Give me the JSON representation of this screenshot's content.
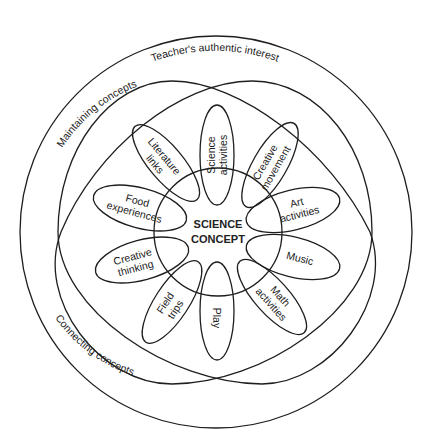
{
  "diagram": {
    "outer_ring_label": "Teacher's authentic interest",
    "left_upper_label": "Maintaining concepts",
    "left_lower_label": "Connecting concepts",
    "center": {
      "line1": "SCIENCE",
      "line2": "CONCEPT"
    },
    "petals": [
      {
        "id": "science-activities",
        "line1": "Science",
        "line2": "activities"
      },
      {
        "id": "creative-movement",
        "line1": "Creative",
        "line2": "movement"
      },
      {
        "id": "art-activities",
        "line1": "Art",
        "line2": "activities"
      },
      {
        "id": "music",
        "line1": "Music",
        "line2": ""
      },
      {
        "id": "math-activities",
        "line1": "Math",
        "line2": "activities"
      },
      {
        "id": "play",
        "line1": "Play",
        "line2": ""
      },
      {
        "id": "field-trips",
        "line1": "Field",
        "line2": "trips"
      },
      {
        "id": "creative-thinking",
        "line1": "Creative",
        "line2": "thinking"
      },
      {
        "id": "food-experiences",
        "line1": "Food",
        "line2": "experiences"
      },
      {
        "id": "literature-links",
        "line1": "Literature",
        "line2": "links"
      }
    ],
    "colors": {
      "line": "#1e1e1e",
      "text": "#222222",
      "background": "#ffffff"
    }
  }
}
